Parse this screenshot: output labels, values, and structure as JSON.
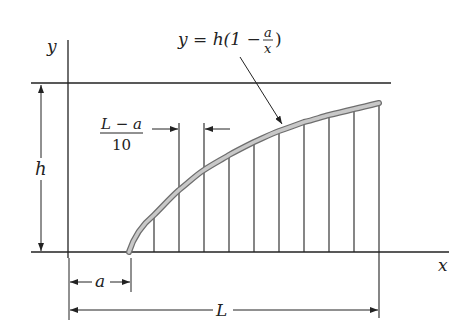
{
  "figure": {
    "axes": {
      "x_label": "x",
      "y_label": "y"
    },
    "equation": {
      "lhs": "y = h(1 − ",
      "frac_num": "a",
      "frac_den": "x",
      "rhs": ")"
    },
    "spacing": {
      "frac_num": "L − a",
      "frac_den": "10"
    },
    "dimensions": {
      "height": "h",
      "offset": "a",
      "length": "L"
    },
    "strips": 10,
    "colors": {
      "line": "#222222",
      "curve_fill": "#bdbdbd",
      "curve_edge": "#6e6e6e"
    }
  }
}
